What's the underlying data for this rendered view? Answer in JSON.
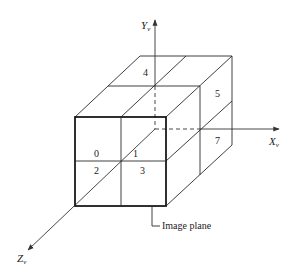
{
  "diagram": {
    "axes": {
      "y": {
        "label": "Y",
        "subscript": "v"
      },
      "x": {
        "label": "X",
        "subscript": "v"
      },
      "z": {
        "label": "Z",
        "subscript": "v"
      }
    },
    "octant_labels": [
      "0",
      "1",
      "2",
      "3",
      "4",
      "5",
      "7"
    ],
    "callout": "Image plane"
  }
}
